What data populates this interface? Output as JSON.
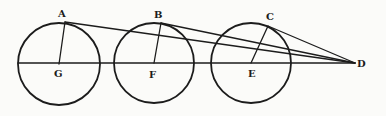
{
  "figure": {
    "points": {
      "A": {
        "label": "A"
      },
      "B": {
        "label": "B"
      },
      "C": {
        "label": "C"
      },
      "D": {
        "label": "D"
      },
      "E": {
        "label": "E"
      },
      "F": {
        "label": "F"
      },
      "G": {
        "label": "G"
      }
    },
    "circles": [
      {
        "center": "G",
        "through": "A"
      },
      {
        "center": "F",
        "through": "B"
      },
      {
        "center": "E",
        "through": "C"
      }
    ],
    "segments": [
      {
        "from": "G",
        "to": "D",
        "note": "common axis line through all centers"
      },
      {
        "from": "G",
        "to": "A"
      },
      {
        "from": "F",
        "to": "B"
      },
      {
        "from": "E",
        "to": "C"
      },
      {
        "from": "A",
        "to": "D"
      },
      {
        "from": "B",
        "to": "D"
      },
      {
        "from": "C",
        "to": "D"
      }
    ],
    "colors": {
      "ink": "#1c1c1c",
      "paper": "#fbfbf9"
    }
  }
}
